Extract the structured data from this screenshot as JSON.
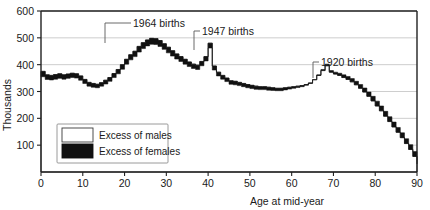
{
  "chart_data": {
    "type": "area",
    "title": "",
    "xlabel": "Age at mid-year",
    "ylabel": "Thousands",
    "xlim": [
      0,
      90
    ],
    "ylim": [
      0,
      600
    ],
    "xticks": [
      0,
      10,
      20,
      30,
      40,
      50,
      60,
      70,
      80,
      90
    ],
    "yticks": [
      0,
      100,
      200,
      300,
      400,
      500,
      600
    ],
    "grid": true,
    "legend_position": "lower-left-inside",
    "series": [
      {
        "name": "Excess of males",
        "fill": "#ffffff",
        "note": "Upper boundary of the band: the larger of the male / female counts per single year of age"
      },
      {
        "name": "Excess of females",
        "fill": "#111111",
        "note": "Filled black region where females exceed males"
      }
    ],
    "x": [
      0,
      1,
      2,
      3,
      4,
      5,
      6,
      7,
      8,
      9,
      10,
      11,
      12,
      13,
      14,
      15,
      16,
      17,
      18,
      19,
      20,
      21,
      22,
      23,
      24,
      25,
      26,
      27,
      28,
      29,
      30,
      31,
      32,
      33,
      34,
      35,
      36,
      37,
      38,
      39,
      40,
      41,
      42,
      43,
      44,
      45,
      46,
      47,
      48,
      49,
      50,
      51,
      52,
      53,
      54,
      55,
      56,
      57,
      58,
      59,
      60,
      61,
      62,
      63,
      64,
      65,
      66,
      67,
      68,
      69,
      70,
      71,
      72,
      73,
      74,
      75,
      76,
      77,
      78,
      79,
      80,
      81,
      82,
      83,
      84,
      85,
      86,
      87,
      88,
      89,
      90
    ],
    "males": [
      375,
      362,
      360,
      363,
      366,
      362,
      365,
      368,
      366,
      358,
      345,
      334,
      330,
      327,
      333,
      342,
      352,
      367,
      382,
      400,
      420,
      437,
      450,
      468,
      482,
      492,
      498,
      497,
      490,
      478,
      465,
      452,
      440,
      430,
      420,
      410,
      402,
      398,
      412,
      430,
      480,
      395,
      372,
      360,
      350,
      340,
      338,
      334,
      330,
      326,
      323,
      320,
      318,
      318,
      316,
      314,
      312,
      312,
      314,
      316,
      318,
      320,
      322,
      326,
      332,
      344,
      360,
      378,
      396,
      372,
      365,
      360,
      352,
      345,
      336,
      325,
      312,
      298,
      282,
      265,
      246,
      228,
      208,
      188,
      168,
      148,
      128,
      106,
      84,
      58,
      30
    ],
    "females": [
      355,
      345,
      343,
      346,
      349,
      346,
      349,
      352,
      350,
      342,
      330,
      320,
      316,
      314,
      320,
      328,
      338,
      352,
      366,
      383,
      402,
      418,
      430,
      447,
      460,
      470,
      476,
      475,
      468,
      457,
      444,
      432,
      421,
      412,
      402,
      393,
      386,
      382,
      396,
      414,
      462,
      380,
      358,
      346,
      337,
      327,
      325,
      322,
      318,
      314,
      311,
      308,
      307,
      307,
      305,
      304,
      303,
      303,
      306,
      309,
      312,
      315,
      318,
      323,
      330,
      344,
      362,
      382,
      402,
      378,
      372,
      368,
      362,
      356,
      348,
      338,
      326,
      313,
      298,
      282,
      264,
      246,
      226,
      206,
      186,
      166,
      146,
      124,
      102,
      76,
      48
    ],
    "annotations": [
      {
        "text": "1964 births",
        "age": 21,
        "value": 500
      },
      {
        "text": "1947 births",
        "age": 38,
        "value": 480
      },
      {
        "text": "1920 births",
        "age": 65,
        "value": 396
      }
    ],
    "legend": [
      {
        "label": "Excess of males",
        "swatch": "white"
      },
      {
        "label": "Excess of females",
        "swatch": "black"
      }
    ]
  },
  "axis": {
    "y_title": "Thousands",
    "x_title": "Age at mid-year",
    "y_labels": [
      "600",
      "500",
      "400",
      "300",
      "200",
      "100"
    ],
    "x_labels": [
      "0",
      "10",
      "20",
      "30",
      "40",
      "50",
      "60",
      "70",
      "80",
      "90"
    ]
  },
  "annotations": {
    "a1": "1964 births",
    "a2": "1947 births",
    "a3": "1920 births"
  },
  "legend": {
    "males": "Excess of males",
    "females": "Excess of females"
  }
}
